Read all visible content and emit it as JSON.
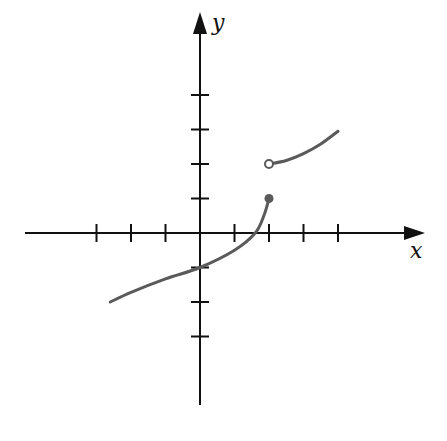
{
  "chart_data": {
    "type": "line",
    "title": "",
    "xlabel": "x",
    "ylabel": "y",
    "xlim": [
      -5,
      6
    ],
    "ylim": [
      -5,
      6
    ],
    "grid": false,
    "x_ticks": [
      -3,
      -2,
      -1,
      1,
      2,
      3,
      4
    ],
    "y_ticks": [
      -3,
      -2,
      -1,
      1,
      2,
      3,
      4
    ],
    "series": [
      {
        "name": "lower-branch",
        "points": [
          [
            -2.6,
            -2.0
          ],
          [
            -2,
            -1.72
          ],
          [
            -1,
            -1.33
          ],
          [
            0,
            -1.0
          ],
          [
            1,
            -0.5
          ],
          [
            1.6,
            0.0
          ],
          [
            1.85,
            0.5
          ],
          [
            2,
            1.0
          ]
        ],
        "end_marker": "closed",
        "end_point": [
          2,
          1
        ]
      },
      {
        "name": "upper-branch",
        "points": [
          [
            2,
            2.0
          ],
          [
            2.5,
            2.1
          ],
          [
            3,
            2.3
          ],
          [
            3.5,
            2.58
          ],
          [
            4,
            2.95
          ]
        ],
        "start_marker": "open",
        "start_point": [
          2,
          2
        ]
      }
    ],
    "colors": {
      "axis": "#111111",
      "curve": "#5a5a5a"
    }
  }
}
